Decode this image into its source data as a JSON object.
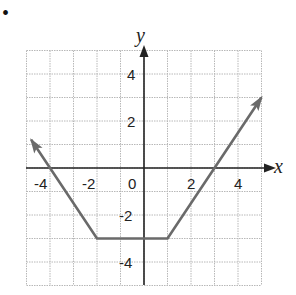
{
  "bullet": "•",
  "chart_data": {
    "type": "line",
    "title": "",
    "xlabel": "x",
    "ylabel": "y",
    "xlim": [
      -5,
      5
    ],
    "ylim": [
      -5,
      5
    ],
    "grid": true,
    "x_ticks": [
      "-4",
      "-2",
      "0",
      "2",
      "4"
    ],
    "y_ticks": [
      "4",
      "2",
      "-2",
      "-4"
    ],
    "series": [
      {
        "name": "piecewise linear function",
        "color": "#6a6a6a",
        "points": [
          [
            -4.8,
            1.2
          ],
          [
            -2,
            -3
          ],
          [
            1,
            -3
          ],
          [
            5,
            3
          ]
        ],
        "arrows": [
          "start",
          "end"
        ]
      }
    ],
    "x_intercepts": [
      -4,
      3
    ],
    "y_intercept": -3
  }
}
